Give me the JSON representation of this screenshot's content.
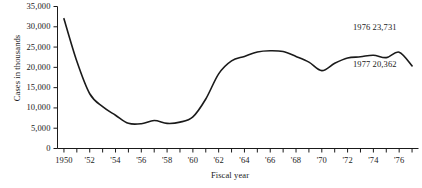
{
  "figure": {
    "background_color": "#ffffff",
    "line_color": "#1a1a1a"
  },
  "chart_data": {
    "type": "line",
    "title": "",
    "xlabel": "Fiscal year",
    "ylabel": "Cases in thousands",
    "xlim": [
      1949.5,
      1977.5
    ],
    "ylim": [
      0,
      35000
    ],
    "grid": false,
    "legend": null,
    "y_ticks": [
      0,
      5000,
      10000,
      15000,
      20000,
      25000,
      30000,
      35000
    ],
    "y_tick_labels": [
      "0",
      "5,000",
      "10,000",
      "15,000",
      "20,000",
      "25,000",
      "30,000",
      "35,000"
    ],
    "x_ticks": [
      1950,
      1951,
      1952,
      1953,
      1954,
      1955,
      1956,
      1957,
      1958,
      1959,
      1960,
      1961,
      1962,
      1963,
      1964,
      1965,
      1966,
      1967,
      1968,
      1969,
      1970,
      1971,
      1972,
      1973,
      1974,
      1975,
      1976,
      1977
    ],
    "x_tick_labels": [
      {
        "x": 1950,
        "label": "1950"
      },
      {
        "x": 1952,
        "label": "'52"
      },
      {
        "x": 1954,
        "label": "'54"
      },
      {
        "x": 1956,
        "label": "'56"
      },
      {
        "x": 1958,
        "label": "'58"
      },
      {
        "x": 1960,
        "label": "'60"
      },
      {
        "x": 1962,
        "label": "'62"
      },
      {
        "x": 1964,
        "label": "'64"
      },
      {
        "x": 1966,
        "label": "'66"
      },
      {
        "x": 1968,
        "label": "'68"
      },
      {
        "x": 1970,
        "label": "'70"
      },
      {
        "x": 1972,
        "label": "'72"
      },
      {
        "x": 1974,
        "label": "'74"
      },
      {
        "x": 1976,
        "label": "'76"
      }
    ],
    "x": [
      1950,
      1951,
      1952,
      1953,
      1954,
      1955,
      1956,
      1957,
      1958,
      1959,
      1960,
      1961,
      1962,
      1963,
      1964,
      1965,
      1966,
      1967,
      1968,
      1969,
      1970,
      1971,
      1972,
      1973,
      1974,
      1975,
      1976,
      1977
    ],
    "values": [
      32000,
      21500,
      13500,
      10300,
      8200,
      6200,
      6100,
      6900,
      6200,
      6500,
      7800,
      12200,
      18400,
      21600,
      22700,
      23800,
      24100,
      23900,
      22700,
      21300,
      19200,
      21000,
      22300,
      22600,
      23000,
      22400,
      23731,
      20362
    ],
    "annotations": [
      {
        "id": "anno-1976",
        "label": "1976 23,731",
        "x": 1976,
        "y": 23731
      },
      {
        "id": "anno-1977",
        "label": "1977 20,362",
        "x": 1977,
        "y": 20362
      }
    ]
  }
}
